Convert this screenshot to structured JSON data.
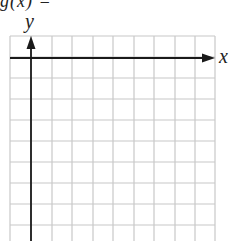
{
  "header": {
    "function_label": "g(x) ="
  },
  "axes": {
    "x_label": "x",
    "y_label": "y"
  },
  "grid": {
    "columns": 10,
    "rows": 10,
    "line_color": "#c8c8c8",
    "axis_color": "#1a1a1a"
  }
}
